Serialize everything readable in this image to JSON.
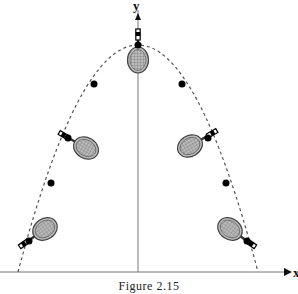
{
  "figure": {
    "caption": "Figure 2.15",
    "x_axis_label": "x",
    "y_axis_label": "y"
  },
  "diagram": {
    "curve": {
      "style": "dashed",
      "shape": "parabola",
      "apex": [
        138,
        45
      ],
      "feet": [
        [
          18,
          272
        ],
        [
          258,
          272
        ]
      ]
    },
    "center_of_mass_points": [
      [
        29,
        241
      ],
      [
        51,
        183
      ],
      [
        68,
        138
      ],
      [
        94,
        84
      ],
      [
        138,
        45
      ],
      [
        182,
        84
      ],
      [
        208,
        138
      ],
      [
        226,
        183
      ],
      [
        247,
        241
      ]
    ],
    "rackets": [
      {
        "position": "lower-left",
        "head": [
          45,
          231
        ],
        "handle_angle": 150
      },
      {
        "position": "mid-left",
        "head": [
          86,
          148
        ],
        "handle_angle": 210
      },
      {
        "position": "top",
        "head": [
          138,
          60
        ],
        "handle_angle": 270
      },
      {
        "position": "mid-right",
        "head": [
          190,
          146
        ],
        "handle_angle": 330
      },
      {
        "position": "lower-right",
        "head": [
          230,
          231
        ],
        "handle_angle": 30
      }
    ],
    "colors": {
      "line": "#555555",
      "dot": "#000000",
      "racket_frame": "#444444"
    }
  }
}
